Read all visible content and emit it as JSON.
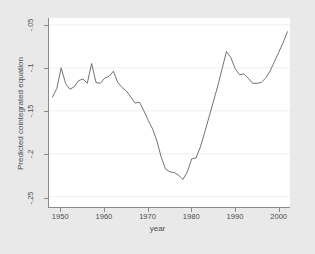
{
  "chart_data": {
    "type": "line",
    "title": "",
    "xlabel": "year",
    "ylabel": "Predicted cointegrated equation",
    "xlim": [
      1947.2,
      2002.6
    ],
    "ylim": [
      -0.262,
      -0.042
    ],
    "grid": true,
    "grid_axis": "y",
    "legend": "none",
    "line_color": "#595959",
    "plot_bgcolor": "#ffffff",
    "figure_bgcolor": "#e9e9e9",
    "xticks": [
      1950,
      1960,
      1970,
      1980,
      1990,
      2000
    ],
    "xticklabels": [
      "1950",
      "1960",
      "1970",
      "1980",
      "1990",
      "2000"
    ],
    "yticks": [
      -0.05,
      -0.1,
      -0.15,
      -0.2,
      -0.25
    ],
    "yticklabels": [
      "-.05",
      "-.1",
      "-.15",
      "-.2",
      "-.25"
    ],
    "series": [
      {
        "name": "Predicted cointegrated equation",
        "x": [
          1948,
          1949,
          1950,
          1951,
          1952,
          1953,
          1954,
          1955,
          1956,
          1957,
          1958,
          1959,
          1960,
          1961,
          1962,
          1963,
          1964,
          1965,
          1966,
          1967,
          1968,
          1969,
          1970,
          1971,
          1972,
          1973,
          1974,
          1975,
          1976,
          1977,
          1978,
          1979,
          1980,
          1981,
          1982,
          1983,
          1984,
          1985,
          1986,
          1987,
          1988,
          1989,
          1990,
          1991,
          1992,
          1993,
          1994,
          1995,
          1996,
          1997,
          1998,
          1999,
          2000,
          2001,
          2002
        ],
        "y": [
          -0.134,
          -0.124,
          -0.1,
          -0.118,
          -0.125,
          -0.122,
          -0.115,
          -0.113,
          -0.118,
          -0.095,
          -0.117,
          -0.118,
          -0.112,
          -0.11,
          -0.104,
          -0.117,
          -0.123,
          -0.127,
          -0.134,
          -0.141,
          -0.14,
          -0.15,
          -0.161,
          -0.171,
          -0.185,
          -0.204,
          -0.218,
          -0.221,
          -0.222,
          -0.225,
          -0.23,
          -0.221,
          -0.206,
          -0.205,
          -0.192,
          -0.175,
          -0.157,
          -0.139,
          -0.121,
          -0.101,
          -0.081,
          -0.088,
          -0.101,
          -0.108,
          -0.107,
          -0.112,
          -0.118,
          -0.118,
          -0.117,
          -0.112,
          -0.104,
          -0.093,
          -0.082,
          -0.071,
          -0.058
        ]
      }
    ]
  },
  "axis": {
    "ytick_labels": [
      "-.05",
      "-.1",
      "-.15",
      "-.2",
      "-.25"
    ],
    "xtick_labels": [
      "1950",
      "1960",
      "1970",
      "1980",
      "1990",
      "2000"
    ],
    "x_title": "year",
    "y_title": "Predicted cointegrated equation"
  }
}
